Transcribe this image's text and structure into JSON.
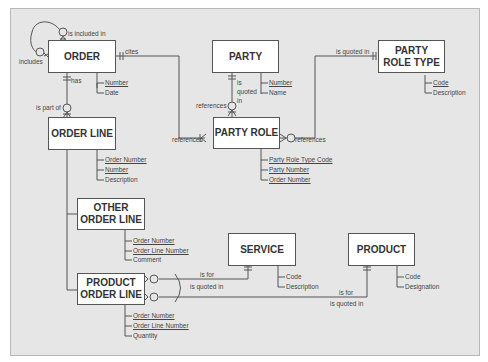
{
  "entities": {
    "order": {
      "name": "ORDER",
      "attributes": [
        {
          "label": "Number",
          "key": true
        },
        {
          "label": "Date",
          "key": false
        }
      ]
    },
    "party": {
      "name": "PARTY",
      "attributes": [
        {
          "label": "Number",
          "key": true
        },
        {
          "label": "Name",
          "key": false
        }
      ]
    },
    "party_role_type": {
      "name_line1": "PARTY",
      "name_line2": "ROLE TYPE",
      "attributes": [
        {
          "label": "Code",
          "key": true
        },
        {
          "label": "Description",
          "key": false
        }
      ]
    },
    "order_line": {
      "name": "ORDER LINE",
      "attributes": [
        {
          "label": "Order Number",
          "key": true
        },
        {
          "label": "Number",
          "key": true
        },
        {
          "label": "Description",
          "key": false
        }
      ]
    },
    "party_role": {
      "name": "PARTY ROLE",
      "attributes": [
        {
          "label": "Party Role Type Code",
          "key": true
        },
        {
          "label": "Party Number",
          "key": true
        },
        {
          "label": "Order Number",
          "key": true
        }
      ]
    },
    "other_order_line": {
      "name_line1": "OTHER",
      "name_line2": "ORDER LINE",
      "attributes": [
        {
          "label": "Order Number",
          "key": true
        },
        {
          "label": "Order Line Number",
          "key": true
        },
        {
          "label": "Comment",
          "key": false
        }
      ]
    },
    "service": {
      "name": "SERVICE",
      "attributes": [
        {
          "label": "Code",
          "key": true
        },
        {
          "label": "Description",
          "key": false
        }
      ]
    },
    "product": {
      "name": "PRODUCT",
      "attributes": [
        {
          "label": "Code",
          "key": true
        },
        {
          "label": "Designation",
          "key": false
        }
      ]
    },
    "product_order_line": {
      "name_line1": "PRODUCT",
      "name_line2": "ORDER LINE",
      "attributes": [
        {
          "label": "Order Number",
          "key": true
        },
        {
          "label": "Order Line Number",
          "key": true
        },
        {
          "label": "Quantity",
          "key": false
        }
      ]
    }
  },
  "relationships": {
    "order_self_included": "is included in",
    "order_self_includes": "includes",
    "order_cites": "cites",
    "order_has": "has",
    "order_line_part_of": "is part of",
    "party_quoted_in": "is quoted in",
    "party_role_references_party": "references",
    "party_role_references_order": "references",
    "party_role_type_quoted_in": "is quoted in",
    "party_role_references_type": "references",
    "pol_is_for_service": "is for",
    "pol_service_quoted_in": "is quoted in",
    "pol_is_for_product": "is for",
    "pol_product_quoted_in": "is quoted in"
  }
}
